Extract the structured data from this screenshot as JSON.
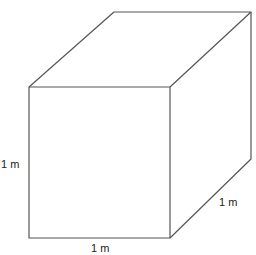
{
  "diagram": {
    "type": "cube",
    "labels": {
      "height": "1 m",
      "width": "1 m",
      "depth": "1 m"
    },
    "colors": {
      "stroke": "#555555",
      "background": "#ffffff"
    }
  }
}
